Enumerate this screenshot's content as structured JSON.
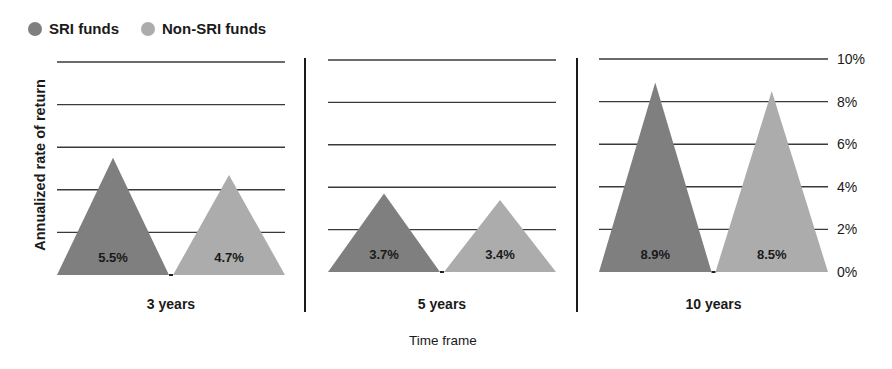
{
  "legend": {
    "items": [
      {
        "label": "SRI funds",
        "color": "#7f7f7f"
      },
      {
        "label": "Non-SRI funds",
        "color": "#acacac"
      }
    ]
  },
  "axes": {
    "ylabel": "Annualized rate of return",
    "xlabel": "Time frame",
    "yticks": [
      "0%",
      "2%",
      "4%",
      "6%",
      "8%",
      "10%"
    ]
  },
  "chart_data": {
    "type": "bar",
    "title": "",
    "xlabel": "Time frame",
    "ylabel": "Annualized rate of return",
    "categories": [
      "3 years",
      "5 years",
      "10 years"
    ],
    "series": [
      {
        "name": "SRI funds",
        "values": [
          5.5,
          3.7,
          8.9
        ],
        "labels": [
          "5.5%",
          "3.7%",
          "8.9%"
        ],
        "color": "#7f7f7f"
      },
      {
        "name": "Non-SRI funds",
        "values": [
          4.7,
          3.4,
          8.5
        ],
        "labels": [
          "4.7%",
          "3.4%",
          "8.5%"
        ],
        "color": "#acacac"
      }
    ],
    "ylim": [
      0,
      10
    ],
    "yticks": [
      0,
      2,
      4,
      6,
      8,
      10
    ],
    "ytick_labels": [
      "0%",
      "2%",
      "4%",
      "6%",
      "8%",
      "10%"
    ],
    "grid": true,
    "legend_position": "top-left",
    "marker": "triangle"
  }
}
